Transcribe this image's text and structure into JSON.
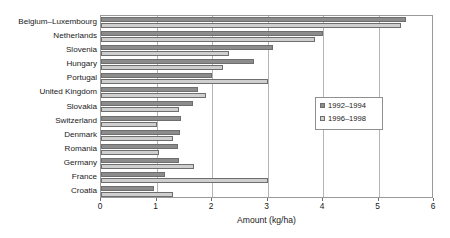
{
  "chart_data": {
    "type": "bar",
    "orientation": "horizontal",
    "title": "",
    "xlabel": "Amount (kg/ha)",
    "ylabel": "",
    "xlim": [
      0,
      6
    ],
    "xticks": [
      0,
      1,
      2,
      3,
      4,
      5,
      6
    ],
    "grid": true,
    "legend_position": "center-right",
    "categories": [
      "Belgium–Luxembourg",
      "Netherlands",
      "Slovenia",
      "Hungary",
      "Portugal",
      "United Kingdom",
      "Slovakia",
      "Switzerland",
      "Denmark",
      "Romania",
      "Germany",
      "France",
      "Croatia"
    ],
    "series": [
      {
        "name": "1992–1994",
        "color": "#8c8c8c",
        "values": [
          5.5,
          4.0,
          3.1,
          2.75,
          2.0,
          1.75,
          1.65,
          1.45,
          1.42,
          1.38,
          1.4,
          1.15,
          0.95
        ]
      },
      {
        "name": "1996–1998",
        "color": "#cfcfcf",
        "values": [
          5.4,
          3.85,
          2.3,
          2.2,
          3.0,
          1.9,
          1.4,
          1.0,
          1.3,
          1.05,
          1.68,
          3.0,
          1.3
        ]
      }
    ]
  },
  "legend": {
    "entries": [
      {
        "label": "1992–1994"
      },
      {
        "label": "1996–1998"
      }
    ]
  }
}
